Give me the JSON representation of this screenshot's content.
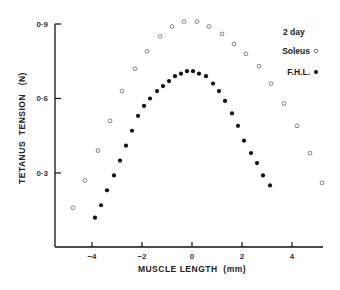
{
  "chart_data": {
    "type": "scatter",
    "title": "",
    "xlabel": "MUSCLE LENGTH  (mm)",
    "ylabel": "TETANUS  TENSION   (N)",
    "xlim": [
      -5.5,
      5.3
    ],
    "ylim": [
      0,
      0.9
    ],
    "x_ticks": [
      -4,
      -2,
      0,
      2,
      4
    ],
    "x_tick_labels": [
      "−4",
      "−2",
      "0",
      "2",
      "4"
    ],
    "y_ticks": [
      0.3,
      0.6,
      0.9
    ],
    "y_tick_labels": [
      "0·3",
      "0·6",
      "0·9"
    ],
    "grid": false,
    "legend": {
      "title": "2 day",
      "position": "upper right",
      "entries": [
        "Soleus",
        "F.H.L."
      ]
    },
    "series": [
      {
        "name": "Soleus",
        "marker": "open-circle",
        "x": [
          -4.76,
          -4.28,
          -3.76,
          -3.28,
          -2.8,
          -2.28,
          -1.8,
          -1.28,
          -0.8,
          -0.32,
          0.2,
          0.68,
          1.2,
          1.68,
          2.16,
          2.68,
          3.16,
          3.68,
          4.2,
          4.72,
          5.2
        ],
        "y": [
          0.16,
          0.27,
          0.39,
          0.51,
          0.63,
          0.72,
          0.79,
          0.85,
          0.89,
          0.91,
          0.91,
          0.89,
          0.86,
          0.82,
          0.78,
          0.73,
          0.66,
          0.58,
          0.49,
          0.38,
          0.26
        ]
      },
      {
        "name": "F.H.L.",
        "marker": "filled-circle",
        "x": [
          -3.88,
          -3.64,
          -3.4,
          -3.12,
          -2.88,
          -2.64,
          -2.4,
          -2.16,
          -1.92,
          -1.68,
          -1.4,
          -1.16,
          -0.92,
          -0.68,
          -0.44,
          -0.2,
          0.04,
          0.28,
          0.56,
          0.84,
          1.08,
          1.32,
          1.6,
          1.84,
          2.08,
          2.36,
          2.6,
          2.84,
          3.12
        ],
        "y": [
          0.12,
          0.17,
          0.23,
          0.29,
          0.35,
          0.41,
          0.47,
          0.53,
          0.57,
          0.6,
          0.63,
          0.65,
          0.67,
          0.69,
          0.7,
          0.71,
          0.71,
          0.7,
          0.69,
          0.66,
          0.63,
          0.59,
          0.54,
          0.49,
          0.43,
          0.38,
          0.34,
          0.29,
          0.25
        ]
      }
    ]
  },
  "labels": {
    "legend_title": "2 day",
    "legend_soleus": "Soleus",
    "legend_fhl": "F.H.L.",
    "xlabel": "MUSCLE LENGTH  (mm)",
    "ylabel": "TETANUS  TENSION   (N)"
  }
}
